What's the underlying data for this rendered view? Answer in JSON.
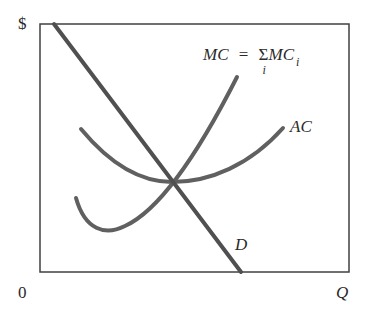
{
  "axes": {
    "y_label": "$",
    "x_label": "Q",
    "origin_label": "0"
  },
  "curves": {
    "demand": {
      "label": "D",
      "color": "#505050"
    },
    "marginal_cost": {
      "label_lhs": "MC",
      "equals": "=",
      "sigma": "Σ",
      "sum_index": "i",
      "label_rhs": "MC",
      "rhs_subscript": "i",
      "color": "#606060"
    },
    "average_cost": {
      "label": "AC",
      "color": "#606060"
    }
  },
  "colors": {
    "frame": "#404040",
    "text": "#2a2a2a",
    "background": "#ffffff"
  }
}
